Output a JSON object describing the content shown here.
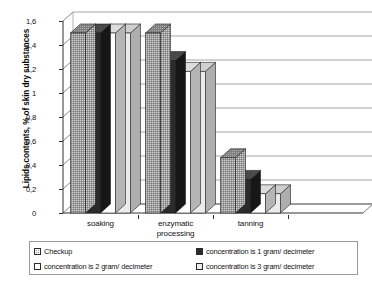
{
  "chart_data": {
    "type": "bar",
    "title": "",
    "xlabel": "",
    "ylabel": "Lipids contents, % of skin dry substances",
    "ylim": [
      0,
      1.6
    ],
    "y_ticks": [
      "0",
      "0,2",
      "0,4",
      "0,6",
      "0,8",
      "1",
      "1,2",
      "1,4",
      "1,6"
    ],
    "y_tick_values": [
      0,
      0.2,
      0.4,
      0.6,
      0.8,
      1,
      1.2,
      1.4,
      1.6
    ],
    "categories": [
      "soaking",
      "enzymatic processing",
      "tanning",
      ""
    ],
    "category_lines": [
      [
        "soaking"
      ],
      [
        "enzymatic",
        "processing"
      ],
      [
        "tanning"
      ],
      [
        ""
      ]
    ],
    "grid": true,
    "legend_position": "bottom",
    "series": [
      {
        "name": "Checkup",
        "fill": "gray-dotted",
        "color": "#9a9a9a",
        "values": [
          1.5,
          1.5,
          0.46,
          0
        ]
      },
      {
        "name": "concentration is 1 gram/ decimeter",
        "fill": "solid-dark",
        "color": "#2b2b2b",
        "values": [
          1.5,
          1.27,
          0.28,
          0
        ]
      },
      {
        "name": "concentration   is 2 gram/ decimeter",
        "fill": "white",
        "color": "#ffffff",
        "values": [
          1.5,
          1.18,
          0.16,
          0
        ]
      },
      {
        "name": "concentration   is 3 gram/ decimeter",
        "fill": "light-gray",
        "color": "#ebebeb",
        "values": [
          1.5,
          1.18,
          0.16,
          0
        ]
      }
    ]
  },
  "legend": {
    "entries": [
      {
        "label": "Checkup",
        "swatch": "checkup-swatch"
      },
      {
        "label": "concentration is 1 gram/ decimeter",
        "swatch": "conc1-swatch"
      },
      {
        "label": "concentration   is 2 gram/ decimeter",
        "swatch": "conc2-swatch"
      },
      {
        "label": "concentration   is 3 gram/ decimeter",
        "swatch": "conc3-swatch"
      }
    ]
  }
}
